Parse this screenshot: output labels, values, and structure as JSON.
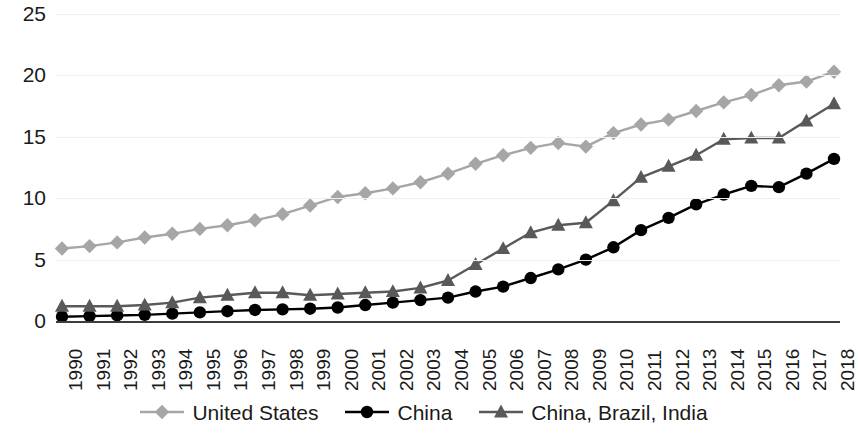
{
  "chart_data": {
    "type": "line",
    "title": "",
    "subtitle": "",
    "xlabel": "",
    "ylabel": "",
    "ylim": [
      0,
      25
    ],
    "yticks": [
      0,
      5,
      10,
      15,
      20,
      25
    ],
    "grid": true,
    "legend_position": "bottom",
    "categories": [
      "1990",
      "1991",
      "1992",
      "1993",
      "1994",
      "1995",
      "1996",
      "1997",
      "1998",
      "1999",
      "2000",
      "2001",
      "2002",
      "2003",
      "2004",
      "2005",
      "2006",
      "2007",
      "2008",
      "2009",
      "2010",
      "2011",
      "2012",
      "2013",
      "2014",
      "2015",
      "2016",
      "2017",
      "2018"
    ],
    "series": [
      {
        "name": "United States",
        "color": "#a6a6a6",
        "marker": "diamond",
        "values": [
          5.9,
          6.1,
          6.4,
          6.8,
          7.1,
          7.5,
          7.8,
          8.2,
          8.7,
          9.4,
          10.1,
          10.4,
          10.8,
          11.3,
          12.0,
          12.8,
          13.5,
          14.1,
          14.5,
          14.2,
          15.3,
          16.0,
          16.4,
          17.1,
          17.8,
          18.4,
          19.2,
          19.5,
          20.3
        ]
      },
      {
        "name": "China",
        "color": "#000000",
        "marker": "circle",
        "values": [
          0.35,
          0.4,
          0.45,
          0.5,
          0.6,
          0.7,
          0.8,
          0.9,
          0.95,
          1.0,
          1.1,
          1.3,
          1.5,
          1.7,
          1.9,
          2.4,
          2.8,
          3.5,
          4.2,
          5.0,
          6.0,
          7.4,
          8.4,
          9.5,
          10.3,
          11.0,
          10.9,
          12.0,
          13.2
        ]
      },
      {
        "name": "China, Brazil, India",
        "color": "#595959",
        "marker": "triangle",
        "values": [
          1.2,
          1.2,
          1.2,
          1.3,
          1.5,
          1.9,
          2.1,
          2.3,
          2.3,
          2.1,
          2.2,
          2.3,
          2.4,
          2.7,
          3.3,
          4.6,
          5.9,
          7.2,
          7.8,
          8.0,
          9.8,
          11.7,
          12.6,
          13.5,
          14.8,
          14.9,
          14.9,
          16.3,
          17.7
        ]
      }
    ]
  },
  "legend": {
    "items": [
      {
        "label": "United States"
      },
      {
        "label": "China"
      },
      {
        "label": "China, Brazil, India"
      }
    ]
  }
}
